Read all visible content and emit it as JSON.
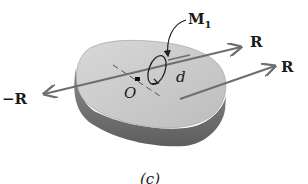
{
  "figure": {
    "caption": "(c)",
    "body": {
      "description": "rigid body",
      "top_color": "#c9c9c9",
      "side_color": "#7a7a7a",
      "edge_color": "#5a5a5a"
    },
    "point": {
      "label": "O"
    },
    "moment": {
      "label_main": "M",
      "label_sub": "1"
    },
    "distance": {
      "label": "d"
    },
    "vectors": [
      {
        "id": "R_through_O",
        "label": "R"
      },
      {
        "id": "R_offset",
        "label": "R"
      },
      {
        "id": "neg_R",
        "label": "−R"
      }
    ],
    "vector_color": "#6e6e6e"
  }
}
